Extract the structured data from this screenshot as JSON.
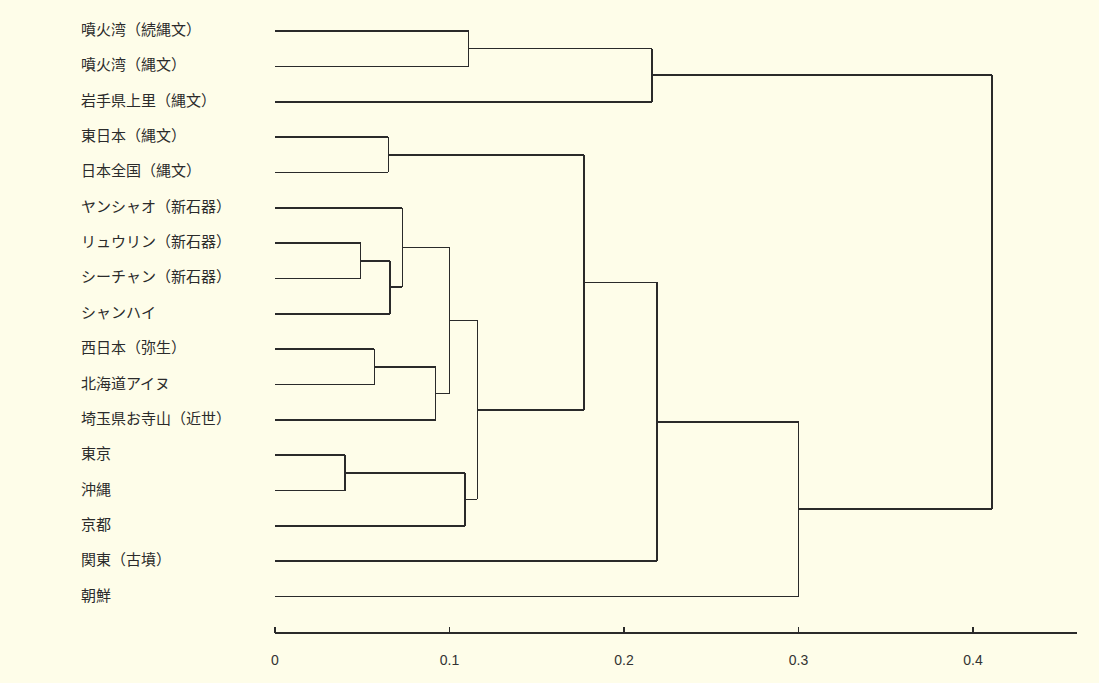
{
  "chart_data": {
    "type": "dendrogram",
    "title": "",
    "xlabel": "",
    "ylabel": "",
    "orientation": "horizontal",
    "xlim": [
      0,
      0.46
    ],
    "x_ticks": [
      0,
      0.1,
      0.2,
      0.3,
      0.4
    ],
    "x_tick_labels": [
      "0",
      "0.1",
      "0.2",
      "0.3",
      "0.4"
    ],
    "grid": false,
    "leaves": [
      "噴火湾（続縄文）",
      "噴火湾（縄文）",
      "岩手県上里（縄文）",
      "東日本（縄文）",
      "日本全国（縄文）",
      "ヤンシャオ（新石器）",
      "リュウリン（新石器）",
      "シーチャン（新石器）",
      "シャンハイ",
      "西日本（弥生）",
      "北海道アイヌ",
      "埼玉県お寺山（近世）",
      "東京",
      "沖縄",
      "京都",
      "関東（古墳）",
      "朝鮮"
    ],
    "merges": [
      {
        "id": "m1",
        "left": "L0",
        "right": "L1",
        "height": 0.111
      },
      {
        "id": "m2",
        "left": "m1",
        "right": "L2",
        "height": 0.216
      },
      {
        "id": "m3",
        "left": "L3",
        "right": "L4",
        "height": 0.065
      },
      {
        "id": "m4",
        "left": "L6",
        "right": "L7",
        "height": 0.049
      },
      {
        "id": "m5",
        "left": "m4",
        "right": "L8",
        "height": 0.066
      },
      {
        "id": "m6",
        "left": "L5",
        "right": "m5",
        "height": 0.073
      },
      {
        "id": "m7",
        "left": "L9",
        "right": "L10",
        "height": 0.057
      },
      {
        "id": "m8",
        "left": "m7",
        "right": "L11",
        "height": 0.092
      },
      {
        "id": "m9",
        "left": "m6",
        "right": "m8",
        "height": 0.1
      },
      {
        "id": "m10",
        "left": "L12",
        "right": "L13",
        "height": 0.04
      },
      {
        "id": "m11",
        "left": "m10",
        "right": "L14",
        "height": 0.109
      },
      {
        "id": "m12",
        "left": "m9",
        "right": "m11",
        "height": 0.116
      },
      {
        "id": "m13",
        "left": "m3",
        "right": "m12",
        "height": 0.177
      },
      {
        "id": "m14",
        "left": "m13",
        "right": "L15",
        "height": 0.219
      },
      {
        "id": "m15",
        "left": "m14",
        "right": "L16",
        "height": 0.3
      },
      {
        "id": "m16",
        "left": "m2",
        "right": "m15",
        "height": 0.411
      }
    ]
  },
  "layout": {
    "x0_px": 275,
    "px_per_unit": 1745,
    "leaf_y0": 31,
    "leaf_dy": 35.35,
    "axis_y": 633,
    "axis_end_px": 1077
  }
}
